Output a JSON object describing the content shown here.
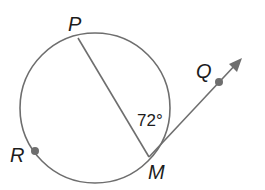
{
  "diagram": {
    "type": "circle-geometry",
    "circle": {
      "cx": 95,
      "cy": 108,
      "r": 75
    },
    "points": {
      "P": {
        "label": "P",
        "x": 78,
        "y": 38,
        "on_circle": true
      },
      "M": {
        "label": "M",
        "x": 149,
        "y": 157,
        "on_circle": true
      },
      "R": {
        "label": "R",
        "x": 35,
        "y": 151,
        "on_circle": true,
        "marked": true
      },
      "Q": {
        "label": "Q",
        "x": 219,
        "y": 82,
        "marked": true
      }
    },
    "segments": [
      {
        "name": "chord-PM",
        "from": "P",
        "to": "M"
      }
    ],
    "rays": [
      {
        "name": "ray-MQ",
        "from": "M",
        "through": "Q",
        "arrow": true
      }
    ],
    "angles": [
      {
        "name": "angle-PMQ",
        "vertex": "M",
        "between": [
          "P",
          "Q"
        ],
        "label": "72°",
        "value": 72
      }
    ],
    "colors": {
      "line": "#6e6e6e",
      "text": "#1c1c1c",
      "background": "#ffffff"
    }
  }
}
